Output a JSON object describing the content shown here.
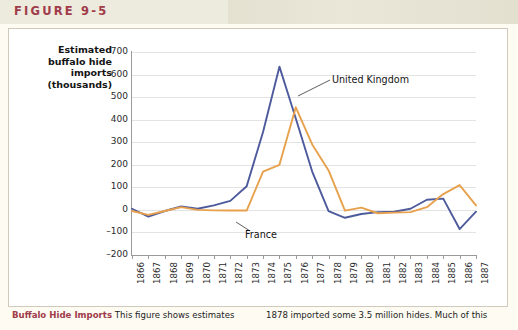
{
  "banner": {
    "figure_label": "FIGURE 9-5"
  },
  "chart_data": {
    "type": "line",
    "title": "",
    "ylabel": "Estimated buffalo hide imports (thousands)",
    "ylabel_lines": [
      "Estimated",
      "buffalo hide",
      "imports",
      "(thousands)"
    ],
    "xlabel": "",
    "ylim": [
      -200,
      700
    ],
    "yticks": [
      700,
      600,
      500,
      400,
      300,
      200,
      100,
      0,
      -100,
      -200
    ],
    "grid": true,
    "legend_position": "inline-callouts",
    "categories": [
      "1866",
      "1867",
      "1868",
      "1869",
      "1870",
      "1871",
      "1872",
      "1873",
      "1874",
      "1875",
      "1876",
      "1877",
      "1878",
      "1879",
      "1880",
      "1881",
      "1882",
      "1883",
      "1884",
      "1885",
      "1886",
      "1887"
    ],
    "series": [
      {
        "name": "United Kingdom",
        "color": "#4d5a9c",
        "values": [
          5,
          -30,
          -5,
          15,
          5,
          20,
          40,
          105,
          345,
          635,
          405,
          170,
          -5,
          -35,
          -18,
          -10,
          -8,
          5,
          45,
          50,
          -85,
          -8
        ]
      },
      {
        "name": "France",
        "color": "#e7a14c",
        "values": [
          -5,
          -22,
          -5,
          12,
          0,
          -2,
          -3,
          -3,
          170,
          200,
          455,
          290,
          175,
          -3,
          10,
          -15,
          -12,
          -10,
          12,
          70,
          110,
          20
        ]
      }
    ],
    "annotations": [
      {
        "label": "United Kingdom",
        "series": "United Kingdom"
      },
      {
        "label": "France",
        "series": "France"
      }
    ]
  },
  "caption": {
    "title": "Buffalo Hide Imports",
    "left_text": " This figure shows estimates",
    "right_text": "1878 imported some 3.5 million hides. Much of this"
  }
}
